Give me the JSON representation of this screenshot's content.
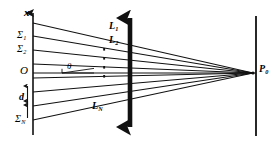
{
  "figure": {
    "background": "#ffffff",
    "ink": "#1a1a1a",
    "width": 280,
    "height": 145,
    "axis": {
      "vertical_label": "x",
      "origin_label": "O",
      "spacing_label": "d",
      "horizontal_axis_name": "optical-axis"
    },
    "source_planes": [
      {
        "id": "s1",
        "label": "Σ",
        "sub": "1",
        "y": 36
      },
      {
        "id": "s2",
        "label": "Σ",
        "sub": "2",
        "y": 50
      },
      {
        "id": "sN",
        "label": "Σ",
        "sub": "N",
        "y": 120
      }
    ],
    "rays": [
      {
        "id": "L1",
        "label": "L",
        "sub": "1"
      },
      {
        "id": "L2",
        "label": "L",
        "sub": "2"
      },
      {
        "id": "LN",
        "label": "L",
        "sub": "N"
      }
    ],
    "ellipsis_marker": "⋮",
    "angle_label": "θ",
    "focus_point": {
      "label": "P",
      "sub": "0"
    },
    "elements": {
      "lens_name": "lens-aperture-double-arrow",
      "screen_name": "image-screen-line"
    }
  }
}
